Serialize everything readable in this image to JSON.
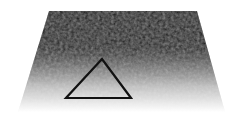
{
  "figure": {
    "plane": {
      "points": [
        [
          49,
          11
        ],
        [
          197,
          11
        ],
        [
          225,
          112
        ],
        [
          18,
          112
        ]
      ],
      "gradient_top": "#050505",
      "gradient_mid": "#8a8a8a",
      "gradient_bottom": "#ffffff"
    },
    "triangle": {
      "points": [
        [
          102,
          59
        ],
        [
          66,
          98
        ],
        [
          131,
          98
        ]
      ],
      "stroke": "#111111",
      "stroke_width": 2.2
    }
  }
}
